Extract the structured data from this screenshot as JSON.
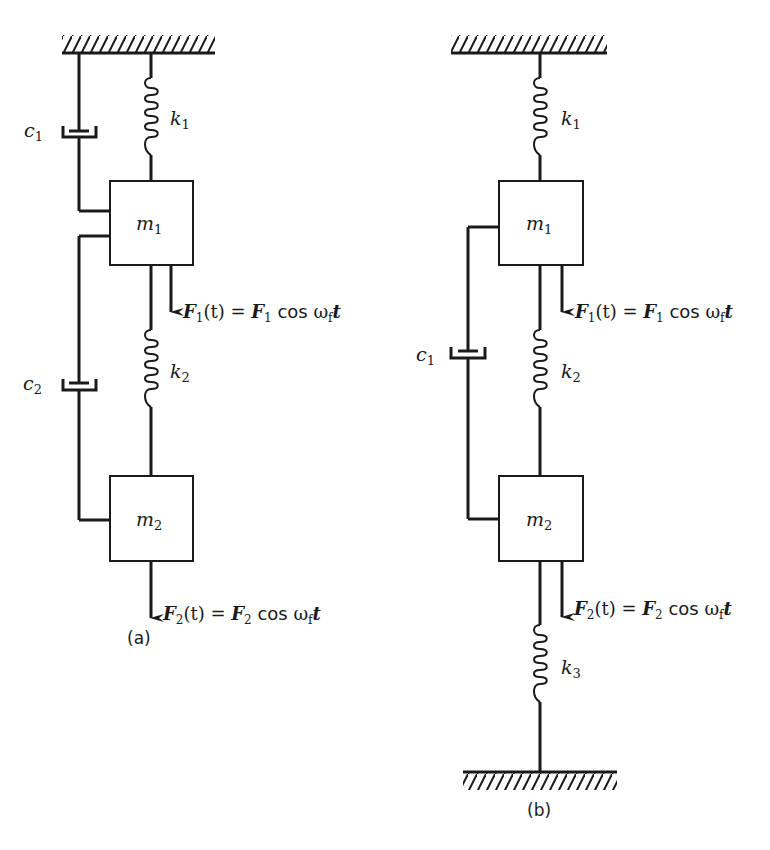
{
  "figure": {
    "panel_a": {
      "caption": "(a)",
      "spring_k1": {
        "sym": "k",
        "sub": "1"
      },
      "spring_k2": {
        "sym": "k",
        "sub": "2"
      },
      "damper_c1": {
        "sym": "c",
        "sub": "1"
      },
      "damper_c2": {
        "sym": "c",
        "sub": "2"
      },
      "mass_m1": {
        "sym": "m",
        "sub": "1"
      },
      "mass_m2": {
        "sym": "m",
        "sub": "2"
      },
      "force_1": {
        "lhs": "F",
        "lhs_sub": "1",
        "arg": "(t)",
        "eq": " = ",
        "rhs": "F",
        "rhs_sub": "1",
        "cos": " cos ",
        "omega": "ω",
        "omega_sub": "f",
        "t": "t"
      },
      "force_2": {
        "lhs": "F",
        "lhs_sub": "2",
        "arg": "(t)",
        "eq": " = ",
        "rhs": "F",
        "rhs_sub": "2",
        "cos": " cos ",
        "omega": "ω",
        "omega_sub": "f",
        "t": "t"
      }
    },
    "panel_b": {
      "caption": "(b)",
      "spring_k1": {
        "sym": "k",
        "sub": "1"
      },
      "spring_k2": {
        "sym": "k",
        "sub": "2"
      },
      "spring_k3": {
        "sym": "k",
        "sub": "3"
      },
      "damper_c1": {
        "sym": "c",
        "sub": "1"
      },
      "mass_m1": {
        "sym": "m",
        "sub": "1"
      },
      "mass_m2": {
        "sym": "m",
        "sub": "2"
      },
      "force_1": {
        "lhs": "F",
        "lhs_sub": "1",
        "arg": "(t)",
        "eq": " = ",
        "rhs": "F",
        "rhs_sub": "1",
        "cos": " cos ",
        "omega": "ω",
        "omega_sub": "f",
        "t": "t"
      },
      "force_2": {
        "lhs": "F",
        "lhs_sub": "2",
        "arg": "(t)",
        "eq": " = ",
        "rhs": "F",
        "rhs_sub": "2",
        "cos": " cos ",
        "omega": "ω",
        "omega_sub": "f",
        "t": "t"
      }
    }
  }
}
